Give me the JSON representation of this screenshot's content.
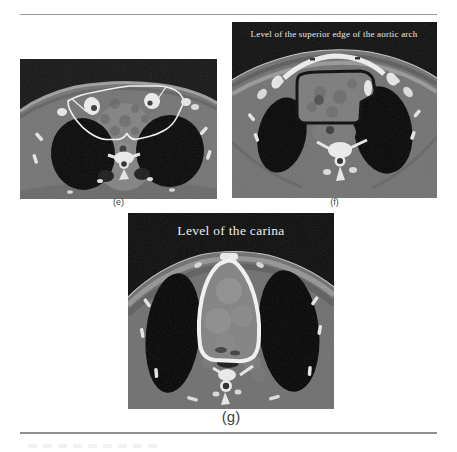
{
  "figure": {
    "panels": {
      "e": {
        "label": "(e)",
        "overlay_title": ""
      },
      "f": {
        "label": "(f)",
        "overlay_title": "Level of the superior edge of the aortic arch"
      },
      "g": {
        "label": "(g)",
        "overlay_title": "Level of the carina"
      }
    }
  },
  "colors": {
    "page_background": "#ffffff",
    "rule_gray": "#979797",
    "ct_air_background": "#141414",
    "body_tissue_gray": "#747474",
    "fat_band_gray": "#a0a0a0",
    "muscle_gray": "#585858",
    "lung_air_black": "#060606",
    "bone_white": "#eeeeee",
    "contour_white": "#f5f5f5",
    "contour_black": "#0a0a0a",
    "overlay_text": "#eeeeee",
    "panel_label_text": "#3f3f3f"
  }
}
